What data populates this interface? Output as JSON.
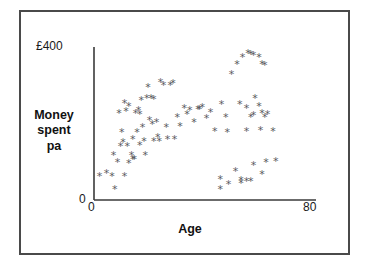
{
  "figure": {
    "border_color": "#4a4a4a",
    "background": "#ffffff"
  },
  "axes": {
    "y_top_label": "£400",
    "y_zero_label": "0",
    "x_zero_label": "0",
    "x_max_label": "80",
    "x_title": "Age",
    "y_title_lines": [
      "Money",
      "spent",
      "pa"
    ]
  },
  "chart_data": {
    "type": "scatter",
    "title": "",
    "xlabel": "Age",
    "ylabel": "Money spent pa",
    "xlim": [
      0,
      80
    ],
    "ylim": [
      0,
      400
    ],
    "xticks": [
      0,
      80
    ],
    "xtick_labels": [
      "0",
      "80"
    ],
    "yticks": [
      0,
      400
    ],
    "ytick_labels": [
      "0",
      "£400"
    ],
    "grid": false,
    "legend": null,
    "marker": "*",
    "marker_color": "#5a5a5e",
    "series": [
      {
        "name": "Money spent per annum vs age",
        "points": [
          [
            2.0,
            62
          ],
          [
            4.5,
            70
          ],
          [
            6.5,
            62
          ],
          [
            7.5,
            30
          ],
          [
            7.0,
            118
          ],
          [
            8.5,
            100
          ],
          [
            9.5,
            140
          ],
          [
            10.5,
            152
          ],
          [
            11.0,
            62
          ],
          [
            9.0,
            228
          ],
          [
            11.5,
            232
          ],
          [
            11.0,
            255
          ],
          [
            12.5,
            245
          ],
          [
            13.5,
            118
          ],
          [
            14.0,
            160
          ],
          [
            14.5,
            108
          ],
          [
            14.0,
            108
          ],
          [
            15.0,
            228
          ],
          [
            16.0,
            235
          ],
          [
            16.5,
            225
          ],
          [
            17.0,
            262
          ],
          [
            15.5,
            178
          ],
          [
            16.5,
            145
          ],
          [
            17.5,
            190
          ],
          [
            18.0,
            155
          ],
          [
            18.5,
            118
          ],
          [
            19.5,
            296
          ],
          [
            20.0,
            210
          ],
          [
            21.0,
            198
          ],
          [
            21.5,
            155
          ],
          [
            22.5,
            205
          ],
          [
            23.0,
            165
          ],
          [
            23.5,
            155
          ],
          [
            24.0,
            308
          ],
          [
            25.0,
            300
          ],
          [
            26.0,
            190
          ],
          [
            26.5,
            160
          ],
          [
            27.5,
            302
          ],
          [
            28.5,
            305
          ],
          [
            29.0,
            160
          ],
          [
            30.0,
            218
          ],
          [
            31.0,
            193
          ],
          [
            32.5,
            240
          ],
          [
            33.5,
            225
          ],
          [
            34.5,
            235
          ],
          [
            36.0,
            205
          ],
          [
            37.5,
            238
          ],
          [
            38.0,
            238
          ],
          [
            39.0,
            242
          ],
          [
            40.5,
            215
          ],
          [
            42.0,
            230
          ],
          [
            43.5,
            180
          ],
          [
            46.0,
            252
          ],
          [
            47.5,
            218
          ],
          [
            48.0,
            178
          ],
          [
            49.5,
            330
          ],
          [
            51.5,
            355
          ],
          [
            53.5,
            375
          ],
          [
            55.5,
            385
          ],
          [
            56.5,
            383
          ],
          [
            57.5,
            380
          ],
          [
            59.5,
            375
          ],
          [
            60.5,
            355
          ],
          [
            61.5,
            352
          ],
          [
            52.5,
            250
          ],
          [
            55.0,
            240
          ],
          [
            56.5,
            218
          ],
          [
            57.5,
            222
          ],
          [
            58.0,
            268
          ],
          [
            59.5,
            245
          ],
          [
            60.5,
            228
          ],
          [
            61.5,
            218
          ],
          [
            62.5,
            225
          ],
          [
            55.0,
            180
          ],
          [
            60.0,
            182
          ],
          [
            64.5,
            180
          ],
          [
            45.5,
            55
          ],
          [
            45.5,
            28
          ],
          [
            48.5,
            42
          ],
          [
            51.0,
            75
          ],
          [
            53.0,
            52
          ],
          [
            53.0,
            45
          ],
          [
            55.0,
            50
          ],
          [
            56.5,
            50
          ],
          [
            57.5,
            92
          ],
          [
            60.5,
            68
          ],
          [
            62.0,
            100
          ],
          [
            65.5,
            102
          ],
          [
            19.0,
            268
          ],
          [
            20.5,
            268
          ],
          [
            21.5,
            265
          ],
          [
            12.0,
            140
          ],
          [
            12.5,
            96
          ],
          [
            10.0,
            178
          ]
        ]
      }
    ]
  }
}
